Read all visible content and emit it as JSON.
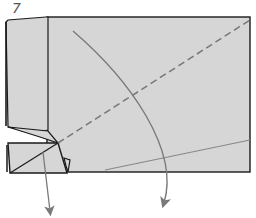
{
  "diagram": {
    "step_number": "7",
    "type": "origami-fold-step",
    "colors": {
      "paper": "#d6d6d6",
      "outline": "#1a1a1a",
      "valley_fold": "#777777",
      "arrow": "#7a7a7a",
      "background": "#ffffff"
    },
    "elements": [
      {
        "name": "paper-sheet",
        "shape": "rectangle",
        "desc": "main folded paper rectangle"
      },
      {
        "name": "left-flap",
        "shape": "polygon",
        "desc": "folded left edge strip"
      },
      {
        "name": "bottom-left-flap",
        "shape": "polygon",
        "desc": "small folded flap with diagonal crease"
      },
      {
        "name": "valley-fold-line",
        "style": "dashed",
        "desc": "diagonal dashed fold line from flap corner to top-right"
      },
      {
        "name": "crease-line",
        "style": "solid-gray",
        "desc": "light crease near bottom right"
      },
      {
        "name": "curved-fold-arrow",
        "desc": "curved arrow from top toward bottom"
      },
      {
        "name": "pull-arrow",
        "desc": "straight arrow pointing down from bottom-left flap"
      }
    ]
  }
}
